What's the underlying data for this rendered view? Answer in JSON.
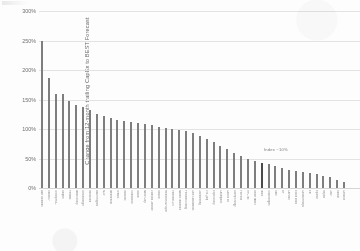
{
  "chart_data": {
    "type": "bar",
    "title": "",
    "subtitle": "",
    "xlabel": "",
    "ylabel": "Change from 12-month trailing CapEx to BEST Forecast",
    "ylim": [
      0,
      300
    ],
    "ytick_labels": [
      "0%",
      "50%",
      "100%",
      "150%",
      "200%",
      "250%",
      "300%"
    ],
    "ytick_values": [
      0,
      50,
      100,
      150,
      200,
      250,
      300
    ],
    "grid": true,
    "legend": "none",
    "annotations": [
      {
        "text": "Index ~10%",
        "near_category_index": 32
      }
    ],
    "highlight_index": 32,
    "categories": [
      "Aker Solutions",
      "Subsea 7",
      "TechnipFMC",
      "Saipem",
      "Petrofac",
      "Wood Group",
      "Schlumberger",
      "Halliburton",
      "Baker Hughes",
      "NOV",
      "Weatherford",
      "Tenaris",
      "Vallourec",
      "Transocean",
      "Valaris",
      "Noble Corp",
      "Diamond Offshore",
      "Seadrill",
      "Helmerich & Payne",
      "Patterson-UTI",
      "Nabors Industries",
      "Precision Drilling",
      "Core Laboratories",
      "Oceaneering",
      "Dril-Quip",
      "Expro Group",
      "ChampionX",
      "Cactus Inc",
      "Liberty Energy",
      "ProPetro",
      "RPC Inc",
      "Select Water",
      "Index",
      "TotalEnergies",
      "Shell",
      "BP",
      "Chevron",
      "Exxon Mobil",
      "ConocoPhillips",
      "Eni",
      "Equinor",
      "Repsol",
      "OMV",
      "Suncor",
      "Cenovus"
    ],
    "values": [
      250,
      186,
      160,
      159,
      147,
      141,
      138,
      133,
      126,
      122,
      119,
      116,
      114,
      112,
      110,
      108,
      106,
      104,
      102,
      100,
      98,
      96,
      94,
      88,
      83,
      78,
      72,
      66,
      60,
      55,
      50,
      46,
      43,
      40,
      37,
      34,
      31,
      29,
      27,
      25,
      23,
      20,
      18,
      14,
      11
    ]
  }
}
